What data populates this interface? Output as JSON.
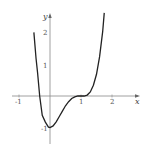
{
  "chart_data": {
    "type": "line",
    "title": "",
    "xlabel": "x",
    "ylabel": "y",
    "xlim": [
      -1.25,
      2.2
    ],
    "ylim": [
      -1.35,
      2.9
    ],
    "grid": false,
    "x_ticks": [
      "-1",
      "1",
      "2"
    ],
    "y_ticks": [
      "1",
      "2",
      "-1"
    ],
    "series": [
      {
        "name": "f(x)",
        "x": [
          -0.52,
          -0.45,
          -0.4,
          -0.333,
          -0.25,
          -0.15,
          -0.05,
          0.0,
          0.1,
          0.2,
          0.3,
          0.4,
          0.5,
          0.6,
          0.7,
          0.8,
          0.9,
          1.0,
          1.1,
          1.2,
          1.3,
          1.4,
          1.5,
          1.6,
          1.7,
          1.75
        ],
        "y": [
          2.02,
          1.19,
          0.73,
          0.0,
          -0.61,
          -0.83,
          -0.99,
          -1.0,
          -0.95,
          -0.82,
          -0.65,
          -0.48,
          -0.31,
          -0.18,
          -0.08,
          -0.03,
          0.0,
          0.0,
          0.0,
          0.03,
          0.13,
          0.34,
          0.69,
          1.25,
          2.05,
          2.64
        ]
      }
    ]
  },
  "labels": {
    "x_axis": "x",
    "y_axis": "y",
    "tick_neg1_x": "-1",
    "tick_1_x": "1",
    "tick_2_x": "2",
    "tick_1_y": "1",
    "tick_2_y": "2",
    "tick_neg1_y": "-1"
  }
}
